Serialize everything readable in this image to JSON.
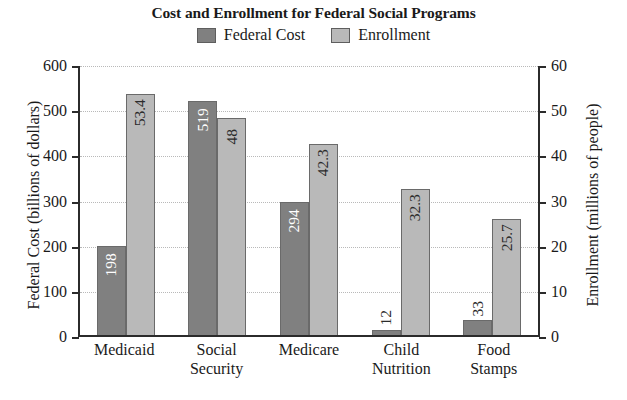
{
  "chart_data": {
    "type": "bar",
    "title": "Cost and Enrollment for Federal Social Programs",
    "xlabel": "",
    "categories": [
      "Medicaid",
      "Social Security",
      "Medicare",
      "Child Nutrition",
      "Food Stamps"
    ],
    "category_lines": [
      [
        "Medicaid"
      ],
      [
        "Social",
        "Security"
      ],
      [
        "Medicare"
      ],
      [
        "Child",
        "Nutrition"
      ],
      [
        "Food",
        "Stamps"
      ]
    ],
    "grid": true,
    "legend_position": "top",
    "series": [
      {
        "name": "Federal Cost",
        "axis": "left",
        "color": "#808080",
        "values": [
          198,
          519,
          294,
          12,
          33
        ],
        "labels": [
          "198",
          "519",
          "294",
          "12",
          "33"
        ]
      },
      {
        "name": "Enrollment",
        "axis": "right",
        "color": "#b9b9b9",
        "values": [
          53.4,
          48,
          42.3,
          32.3,
          25.7
        ],
        "labels": [
          "53.4",
          "48",
          "42.3",
          "32.3",
          "25.7"
        ]
      }
    ],
    "left_axis": {
      "label": "Federal Cost (billions of dollars)",
      "ylim": [
        0,
        600
      ],
      "ticks": [
        0,
        100,
        200,
        300,
        400,
        500,
        600
      ],
      "tick_labels": [
        "0",
        "100",
        "200",
        "300",
        "400",
        "500",
        "600"
      ]
    },
    "right_axis": {
      "label": "Enrollment (millions of people)",
      "ylim": [
        0,
        60
      ],
      "ticks": [
        0,
        10,
        20,
        30,
        40,
        50,
        60
      ],
      "tick_labels": [
        "0",
        "10",
        "20",
        "30",
        "40",
        "50",
        "60"
      ]
    }
  },
  "legend": {
    "entries": [
      {
        "label": "Federal Cost",
        "color": "#808080"
      },
      {
        "label": "Enrollment",
        "color": "#b9b9b9"
      }
    ]
  }
}
